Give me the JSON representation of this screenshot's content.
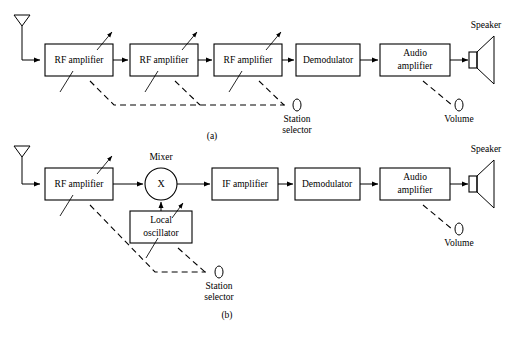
{
  "figure": {
    "caption_a": "(a)",
    "caption_b": "(b)",
    "background": "#ffffff",
    "ink": "#000000"
  },
  "diagram_a": {
    "name": "tuned-radio-frequency-receiver",
    "antenna_label": "",
    "blocks": [
      {
        "id": "rf1",
        "label_line1": "RF amplifier",
        "label_line2": ""
      },
      {
        "id": "rf2",
        "label_line1": "RF amplifier",
        "label_line2": ""
      },
      {
        "id": "rf3",
        "label_line1": "RF amplifier",
        "label_line2": ""
      },
      {
        "id": "demod",
        "label_line1": "Demodulator",
        "label_line2": ""
      },
      {
        "id": "audio",
        "label_line1": "Audio",
        "label_line2": "amplifier"
      }
    ],
    "speaker_label": "Speaker",
    "station_selector_label_line1": "Station",
    "station_selector_label_line2": "selector",
    "volume_label": "Volume"
  },
  "diagram_b": {
    "name": "superheterodyne-receiver",
    "antenna_label": "",
    "blocks": [
      {
        "id": "rf1",
        "label_line1": "RF amplifier",
        "label_line2": ""
      },
      {
        "id": "if",
        "label_line1": "IF amplifier",
        "label_line2": ""
      },
      {
        "id": "demod",
        "label_line1": "Demodulator",
        "label_line2": ""
      },
      {
        "id": "audio",
        "label_line1": "Audio",
        "label_line2": "amplifier"
      },
      {
        "id": "lo",
        "label_line1": "Local",
        "label_line2": "oscillator"
      }
    ],
    "mixer_label": "Mixer",
    "mixer_symbol": "X",
    "speaker_label": "Speaker",
    "station_selector_label_line1": "Station",
    "station_selector_label_line2": "selector",
    "volume_label": "Volume"
  }
}
